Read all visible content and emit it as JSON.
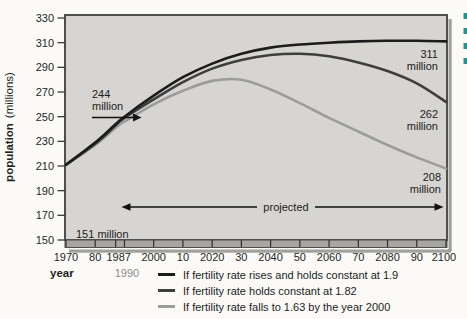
{
  "colors": {
    "plot_background": "#d6d5d2",
    "plot_border": "#4f4f4f",
    "plot_shadow": "#8f8f8c",
    "axis_band": "#a6a5a2",
    "text": "#1f1f1f",
    "muted_text": "#8b8b8b",
    "accent_teal": "#2f8f8a"
  },
  "figure": {
    "y_axis_title_bold": "population",
    "y_axis_title_unit": "(millions)",
    "x_axis_title": "year",
    "x_axis_sub_label": "1990",
    "projected_label": "projected",
    "annotation_244_line1": "244",
    "annotation_244_line2": "million",
    "annotation_151": "151 million",
    "end_labels": {
      "rises": {
        "line1": "311",
        "line2": "million"
      },
      "holds": {
        "line1": "262",
        "line2": "million"
      },
      "falls": {
        "line1": "208",
        "line2": "million"
      }
    }
  },
  "chart_data": {
    "type": "line",
    "title": "",
    "xlabel": "year",
    "ylabel": "population (millions)",
    "xlim": [
      1970,
      2100
    ],
    "ylim": [
      150,
      330
    ],
    "grid": false,
    "legend_position": "bottom",
    "y_ticks": [
      330,
      310,
      290,
      270,
      250,
      230,
      210,
      190,
      170,
      150
    ],
    "extra_x_ticks": [
      1987
    ],
    "x_tick_labels": [
      {
        "label": "1970",
        "year": 1970
      },
      {
        "label": "80",
        "year": 1980
      },
      {
        "label": "1987",
        "year": 1987
      },
      {
        "label": "2000",
        "year": 2000
      },
      {
        "label": "10",
        "year": 2010
      },
      {
        "label": "2020",
        "year": 2020
      },
      {
        "label": "30",
        "year": 2030
      },
      {
        "label": "2040",
        "year": 2040
      },
      {
        "label": "50",
        "year": 2050
      },
      {
        "label": "2060",
        "year": 2060
      },
      {
        "label": "70",
        "year": 2070
      },
      {
        "label": "2080",
        "year": 2080
      },
      {
        "label": "90",
        "year": 2090
      },
      {
        "label": "2100",
        "year": 2100
      }
    ],
    "x": [
      1970,
      1980,
      1987,
      1990,
      2000,
      2010,
      2020,
      2030,
      2040,
      2050,
      2060,
      2070,
      2080,
      2090,
      2100
    ],
    "series": [
      {
        "name": "If fertility rate rises and holds constant at 1.9",
        "color": "#1c1c1c",
        "values": [
          211,
          229,
          244,
          250,
          267,
          282,
          293,
          301,
          306,
          308.5,
          310,
          311,
          311.5,
          311.5,
          311
        ],
        "end_label": "311 million"
      },
      {
        "name": "If fertility rate holds constant at 1.82",
        "color": "#3e3e3e",
        "values": [
          211,
          228,
          243,
          249,
          264,
          278,
          289,
          296,
          300,
          301,
          299,
          294,
          287,
          277,
          262
        ],
        "end_label": "262 million"
      },
      {
        "name": "If fertility rate falls to 1.63 by the year 2000",
        "color": "#9c9c9c",
        "values": [
          211,
          227,
          241,
          246,
          260,
          271,
          279,
          280,
          272,
          261,
          249,
          238,
          227,
          217,
          208
        ],
        "end_label": "208 million"
      }
    ],
    "annotations": [
      {
        "text": "244 million",
        "x": 1987,
        "y": 244
      },
      {
        "text": "151 million",
        "x": 1976,
        "y": 158
      },
      {
        "text": "projected",
        "x": 2045,
        "y": 180,
        "span": [
          1990,
          2100
        ]
      }
    ]
  }
}
